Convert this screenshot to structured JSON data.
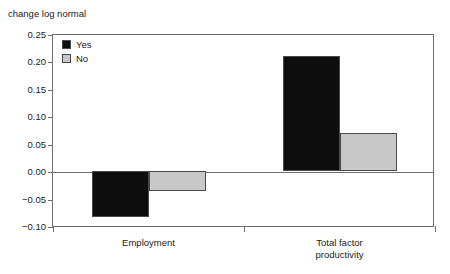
{
  "chart_data": {
    "type": "bar",
    "title": "change log normal",
    "xlabel": "",
    "ylabel": "change log normal",
    "categories": [
      "Employment",
      "Total factor\nproductivity"
    ],
    "series": [
      {
        "name": "Yes",
        "color": "#0d0d0d",
        "values": [
          -0.083,
          0.21
        ]
      },
      {
        "name": "No",
        "color": "#c8c8c8",
        "values": [
          -0.037,
          0.069
        ]
      }
    ],
    "ylim": [
      -0.1,
      0.25
    ],
    "ytick_step": 0.05,
    "ytick_labels": [
      "0.25",
      "0.20",
      "0.15",
      "0.10",
      "0.05",
      "0.00",
      "−0.05",
      "−0.10"
    ],
    "ytick_values": [
      0.25,
      0.2,
      0.15,
      0.1,
      0.05,
      0.0,
      -0.05,
      -0.1
    ],
    "grid": false,
    "zero_line": true,
    "legend_position": "top-left",
    "legend_entries": [
      "Yes",
      "No"
    ]
  },
  "axis": {
    "title": "change log normal"
  },
  "legend": {
    "items": [
      {
        "label": "Yes"
      },
      {
        "label": "No"
      }
    ]
  },
  "colors": {
    "series_yes": "#0d0d0d",
    "series_no": "#c8c8c8",
    "axis_line": "#6e6e6e",
    "bar_border": "#4a4a4a",
    "text": "#1a1a1a",
    "background": "#ffffff"
  }
}
